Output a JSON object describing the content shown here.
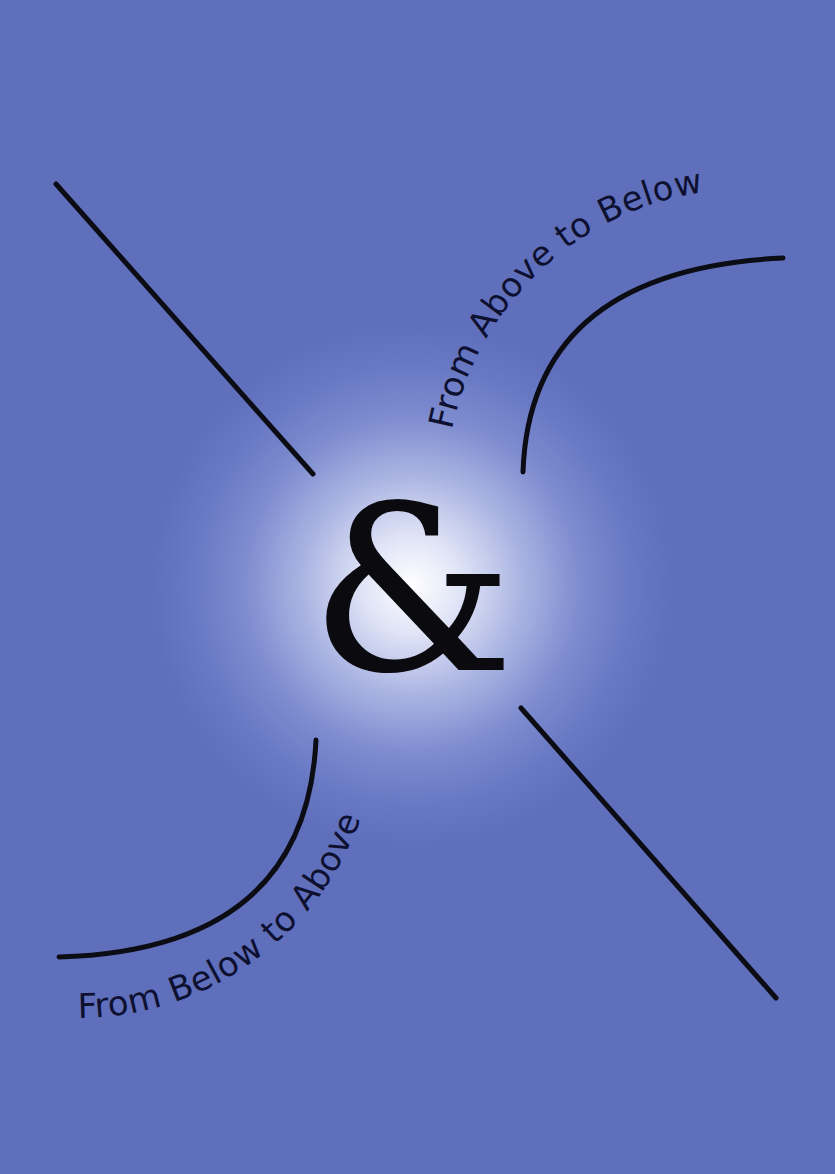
{
  "poster": {
    "center_symbol": "&",
    "text_top_right": "From Above to Below",
    "text_bottom_left": "From Below to Above",
    "colors": {
      "background": "#5f6fbc",
      "glow": "#ffffff",
      "ink": "#0e1030"
    }
  }
}
